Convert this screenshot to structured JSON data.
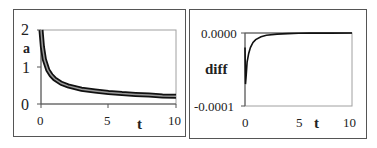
{
  "chart_data": [
    {
      "type": "line",
      "title": "",
      "xlabel": "t",
      "ylabel": "a",
      "xlim": [
        0,
        10
      ],
      "ylim": [
        0,
        2
      ],
      "xticks": [
        "0",
        "5",
        "10"
      ],
      "yticks": [
        "0",
        "1",
        "2"
      ],
      "grid": false,
      "legend": null,
      "series": [
        {
          "name": "a",
          "x": [
            0,
            0.1,
            0.25,
            0.5,
            0.75,
            1,
            1.5,
            2,
            3,
            4,
            5,
            6,
            7,
            8,
            9,
            10
          ],
          "values": [
            2.0,
            1.55,
            1.2,
            0.92,
            0.78,
            0.68,
            0.56,
            0.49,
            0.4,
            0.35,
            0.31,
            0.28,
            0.26,
            0.24,
            0.22,
            0.21
          ]
        }
      ]
    },
    {
      "type": "line",
      "title": "",
      "xlabel": "t",
      "ylabel": "diff",
      "xlim": [
        0,
        10
      ],
      "ylim": [
        -0.0001,
        0.0
      ],
      "xticks": [
        "0",
        "5",
        "10"
      ],
      "yticks": [
        "-0.0001",
        "0.0000"
      ],
      "grid": false,
      "legend": null,
      "series": [
        {
          "name": "diff",
          "x": [
            0,
            0.05,
            0.1,
            0.2,
            0.35,
            0.5,
            0.75,
            1,
            1.5,
            2,
            3,
            4,
            5,
            6,
            8,
            10
          ],
          "values": [
            -2e-05,
            -7e-05,
            -6e-05,
            -4e-05,
            -2.8e-05,
            -2e-05,
            -1.3e-05,
            -9e-06,
            -5e-06,
            -3e-06,
            -1.5e-06,
            -8e-07,
            -4e-07,
            -2e-07,
            -1e-07,
            0.0
          ]
        }
      ]
    }
  ],
  "left": {
    "ylabel": "a",
    "xlabel": "t",
    "yticks": [
      "2",
      "1",
      "0"
    ],
    "xticks": [
      "0",
      "5",
      "10"
    ]
  },
  "right": {
    "ylabel": "diff",
    "xlabel": "t",
    "yticks": [
      "0.0000",
      "-0.0001"
    ],
    "xticks": [
      "0",
      "5",
      "10"
    ]
  },
  "colors": {
    "curve": "#111111",
    "curve_inner": "#9a9a9a",
    "axis": "#555555",
    "plot_border": "#999999"
  }
}
